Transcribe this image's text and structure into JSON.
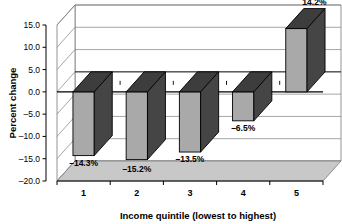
{
  "chart_data": {
    "type": "bar",
    "title": "",
    "subtitle": "",
    "xlabel": "Income quintile (lowest to highest)",
    "ylabel": "Percent change",
    "categories": [
      "1",
      "2",
      "3",
      "4",
      "5"
    ],
    "values": [
      -14.3,
      -15.2,
      -13.5,
      -6.5,
      14.2
    ],
    "data_labels": [
      "–14.3%",
      "–15.2%",
      "–13.5%",
      "–6.5%",
      "14.2%"
    ],
    "ylim": [
      -20.0,
      15.0
    ],
    "ytick_labels": [
      "15.0",
      "10.0",
      "5.0",
      "0.0",
      "–5.0",
      "–10.0",
      "–15.0",
      "–20.0"
    ],
    "ytick_values": [
      15.0,
      10.0,
      5.0,
      0.0,
      -5.0,
      -10.0,
      -15.0,
      -20.0
    ],
    "grid": true,
    "legend": false,
    "legend_position": "none",
    "style": "3d",
    "colors": {
      "bar_front": "#a9a9a9",
      "bar_top": "#3d3d3d",
      "bar_side": "#454545",
      "bar_outline": "#000000",
      "floor": "#c8c8c8",
      "wall": "#ffffff",
      "gridline": "#808080",
      "frame": "#7a7a7a",
      "axis": "#000000",
      "text": "#000000",
      "background": "#ffffff"
    }
  }
}
